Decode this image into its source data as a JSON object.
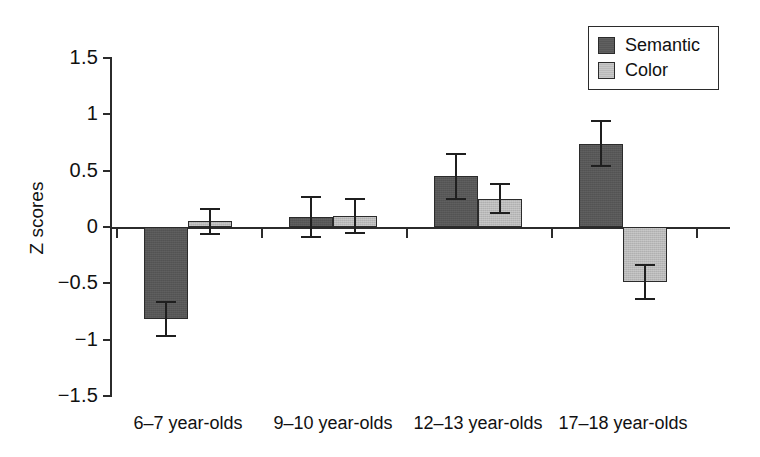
{
  "chart_data": {
    "type": "bar",
    "title": "",
    "xlabel": "",
    "ylabel": "Z scores",
    "ylim": [
      -1.5,
      1.5
    ],
    "grid": false,
    "legend_position": "top-right",
    "categories": [
      "6–7 year-olds",
      "9–10 year-olds",
      "12–13 year-olds",
      "17–18 year-olds"
    ],
    "ytick_labels": [
      "1.5",
      "1",
      "0.5",
      "0",
      "−0.5",
      "−1",
      "−1.5"
    ],
    "ytick_values": [
      1.5,
      1,
      0.5,
      0,
      -0.5,
      -1,
      -1.5
    ],
    "series": [
      {
        "name": "Semantic",
        "color": "#575757",
        "values": [
          -0.82,
          0.09,
          0.45,
          0.74
        ],
        "errors": [
          0.15,
          0.18,
          0.2,
          0.2
        ]
      },
      {
        "name": "Color",
        "color": "#b9b9b9",
        "values": [
          0.05,
          0.1,
          0.25,
          -0.49
        ],
        "errors": [
          0.11,
          0.15,
          0.13,
          0.15
        ]
      }
    ],
    "error_bar_type": "standard error"
  },
  "legend": {
    "items": [
      {
        "label": "Semantic",
        "swatch": "dark-gray"
      },
      {
        "label": "Color",
        "swatch": "light-gray"
      }
    ]
  },
  "axis": {
    "y_title": "Z scores"
  }
}
